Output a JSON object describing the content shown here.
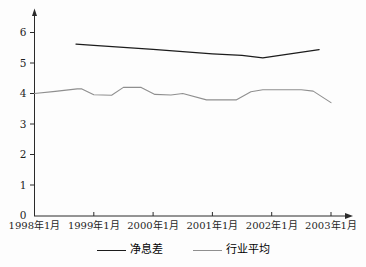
{
  "page": {
    "background": "#fdfdfd"
  },
  "chart_data": {
    "type": "line",
    "title": "",
    "xlabel": "",
    "ylabel": "",
    "grid": false,
    "legend_position": "bottom",
    "axis_color": "#2a2a2a",
    "text_color": "#1f1f1f",
    "x_axis": {
      "min": 1998,
      "max": 2003.35,
      "tick_years": [
        1998,
        1999,
        2000,
        2001,
        2002,
        2003
      ],
      "tick_labels": [
        "1998年1月",
        "1999年1月",
        "2000年1月",
        "2001年1月",
        "2002年1月",
        "2003年1月"
      ]
    },
    "y_axis": {
      "min": 0,
      "max": 6.6,
      "ticks": [
        0,
        1,
        2,
        3,
        4,
        5,
        6
      ]
    },
    "series": [
      {
        "name": "净息差",
        "color": "#1c1c1c",
        "width": 1.3,
        "points": [
          [
            1998.7,
            5.62
          ],
          [
            1999.0,
            5.58
          ],
          [
            2000.0,
            5.45
          ],
          [
            2001.0,
            5.3
          ],
          [
            2001.5,
            5.25
          ],
          [
            2001.85,
            5.17
          ],
          [
            2002.8,
            5.44
          ]
        ]
      },
      {
        "name": "行业平均",
        "color": "#8f8f8f",
        "width": 1.1,
        "points": [
          [
            1998.0,
            4.0
          ],
          [
            1998.35,
            4.07
          ],
          [
            1998.72,
            4.15
          ],
          [
            1998.8,
            4.15
          ],
          [
            1999.0,
            3.96
          ],
          [
            1999.3,
            3.94
          ],
          [
            1999.5,
            4.2
          ],
          [
            1999.8,
            4.2
          ],
          [
            2000.03,
            3.97
          ],
          [
            2000.3,
            3.95
          ],
          [
            2000.5,
            4.0
          ],
          [
            2000.9,
            3.79
          ],
          [
            2001.4,
            3.79
          ],
          [
            2001.65,
            4.06
          ],
          [
            2001.85,
            4.12
          ],
          [
            2002.5,
            4.12
          ],
          [
            2002.7,
            4.08
          ],
          [
            2003.0,
            3.7
          ]
        ]
      }
    ]
  }
}
